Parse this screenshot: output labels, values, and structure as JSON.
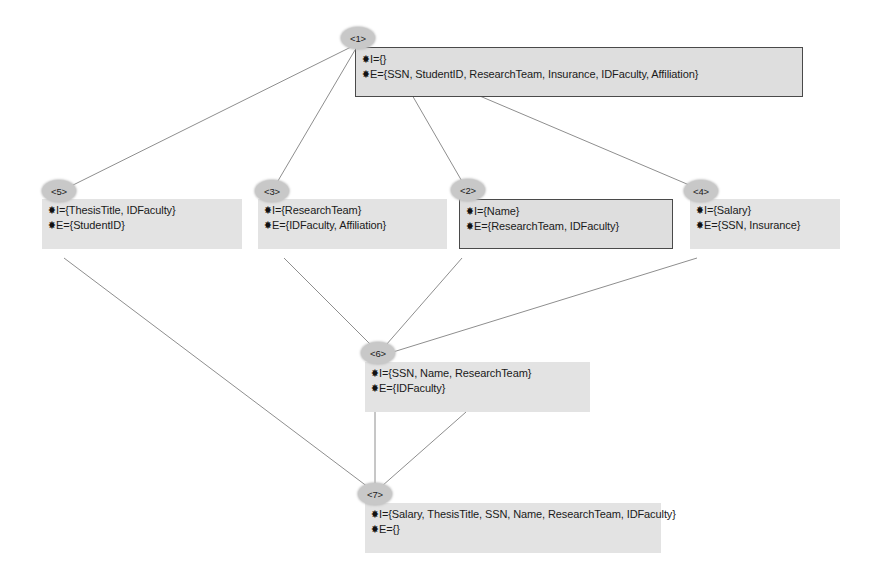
{
  "diagram": {
    "bullet_glyph": "✸",
    "colors": {
      "background": "#ffffff",
      "node_ellipse_fill": "#c8c8c8",
      "node_box_fill": "#e3e3e3",
      "node_box_border": "#4a4a4a",
      "edge_line": "#8a8a8a",
      "text": "#1a1a1a"
    },
    "nodes": [
      {
        "id": "1",
        "label": "<1>",
        "intent": "I={}",
        "extent": "E={SSN, StudentID, ResearchTeam, Insurance, IDFaculty, Affiliation}",
        "bordered": true
      },
      {
        "id": "5",
        "label": "<5>",
        "intent": "I={ThesisTitle, IDFaculty}",
        "extent": "E={StudentID}",
        "bordered": false
      },
      {
        "id": "3",
        "label": "<3>",
        "intent": "I={ResearchTeam}",
        "extent": "E={IDFaculty, Affiliation}",
        "bordered": false
      },
      {
        "id": "2",
        "label": "<2>",
        "intent": "I={Name}",
        "extent": "E={ResearchTeam, IDFaculty}",
        "bordered": true
      },
      {
        "id": "4",
        "label": "<4>",
        "intent": "I={Salary}",
        "extent": "E={SSN, Insurance}",
        "bordered": false
      },
      {
        "id": "6",
        "label": "<6>",
        "intent": "I={SSN, Name, ResearchTeam}",
        "extent": "E={IDFaculty}",
        "bordered": false
      },
      {
        "id": "7",
        "label": "<7>",
        "intent": "I={Salary, ThesisTitle, SSN, Name, ResearchTeam, IDFaculty}",
        "extent": "E={}",
        "bordered": false
      }
    ],
    "edges": [
      {
        "from": "1",
        "to": "5"
      },
      {
        "from": "1",
        "to": "3"
      },
      {
        "from": "1",
        "to": "2"
      },
      {
        "from": "1",
        "to": "4"
      },
      {
        "from": "3",
        "to": "6"
      },
      {
        "from": "2",
        "to": "6"
      },
      {
        "from": "4",
        "to": "6"
      },
      {
        "from": "5",
        "to": "7"
      },
      {
        "from": "2",
        "to": "7"
      },
      {
        "from": "6",
        "to": "7"
      }
    ]
  }
}
